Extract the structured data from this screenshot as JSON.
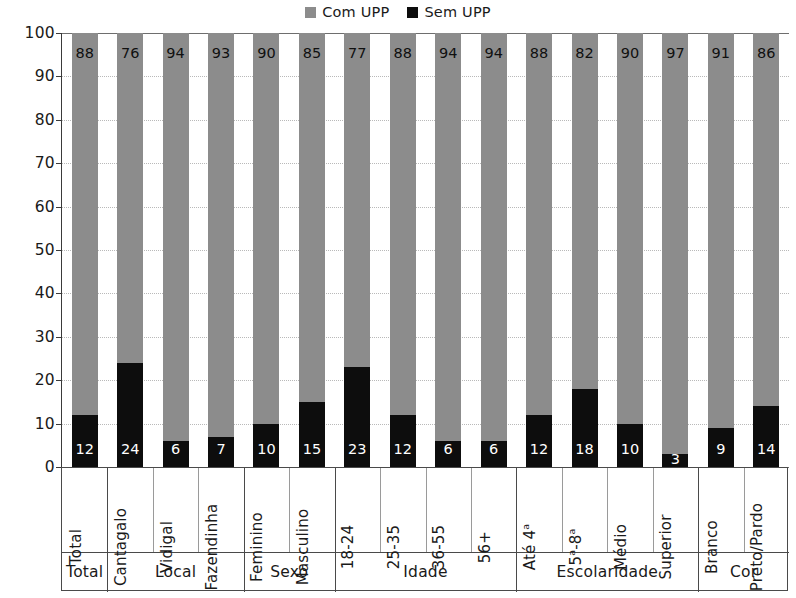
{
  "legend": {
    "entries": [
      {
        "label": "Com UPP",
        "color": "#8c8c8c",
        "icon": "square-swatch-gray"
      },
      {
        "label": "Sem UPP",
        "color": "#0d0d0d",
        "icon": "square-swatch-black"
      }
    ]
  },
  "chart_data": {
    "type": "bar",
    "title": "",
    "xlabel": "",
    "ylabel": "",
    "ylim": [
      0,
      100
    ],
    "yticks": [
      0,
      10,
      20,
      30,
      40,
      50,
      60,
      70,
      80,
      90,
      100
    ],
    "grid": true,
    "stacked": true,
    "stacked_total": 100,
    "legend_position": "top-center",
    "categories": [
      "Total",
      "Cantagalo",
      "Vidigal",
      "Fazendinha",
      "Feminino",
      "Masculino",
      "18-24",
      "25-35",
      "36-55",
      "56+",
      "Até 4ª",
      "5ª-8ª",
      "Médio",
      "Superior",
      "Branco",
      "Preto/Pardo"
    ],
    "series": [
      {
        "name": "Com UPP",
        "color": "#8c8c8c",
        "values": [
          88,
          76,
          94,
          93,
          90,
          85,
          77,
          88,
          94,
          94,
          88,
          82,
          90,
          97,
          91,
          86
        ]
      },
      {
        "name": "Sem UPP",
        "color": "#0d0d0d",
        "values": [
          12,
          24,
          6,
          7,
          10,
          15,
          23,
          12,
          6,
          6,
          12,
          18,
          10,
          3,
          9,
          14
        ]
      }
    ],
    "groups": [
      {
        "label": "Total",
        "count": 1
      },
      {
        "label": "Local",
        "count": 3
      },
      {
        "label": "Sexo",
        "count": 2
      },
      {
        "label": "Idade",
        "count": 4
      },
      {
        "label": "Escolaridade",
        "count": 4
      },
      {
        "label": "Cor",
        "count": 2
      }
    ]
  }
}
